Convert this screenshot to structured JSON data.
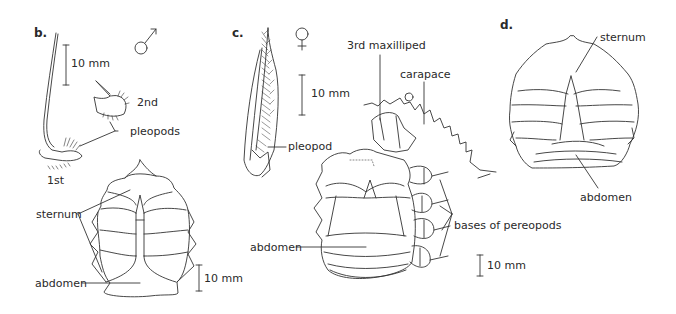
{
  "figure": {
    "panels": [
      {
        "id": "b",
        "label": "b.",
        "sex_symbol": "male-symbol",
        "scale_bars": [
          "10 mm",
          "10 mm"
        ],
        "labels": {
          "second": "2nd",
          "pleopods": "pleopods",
          "first": "1st",
          "sternum": "sternum",
          "abdomen": "abdomen"
        }
      },
      {
        "id": "c",
        "label": "c.",
        "sex_symbol": "female-symbol",
        "scale_bars": [
          "10 mm",
          "10 mm"
        ],
        "labels": {
          "maxilliped": "3rd maxilliped",
          "carapace": "carapace",
          "pleopod": "pleopod",
          "abdomen": "abdomen",
          "pereopods": "bases of pereopods"
        }
      },
      {
        "id": "d",
        "label": "d.",
        "labels": {
          "sternum": "sternum",
          "abdomen": "abdomen"
        }
      }
    ]
  }
}
